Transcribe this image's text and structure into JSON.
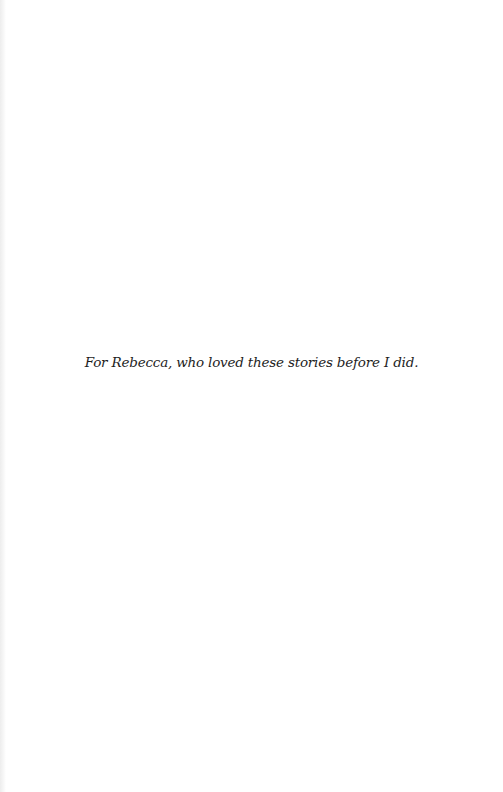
{
  "page": {
    "dedication": "For Rebecca, who loved these stories before I did."
  }
}
